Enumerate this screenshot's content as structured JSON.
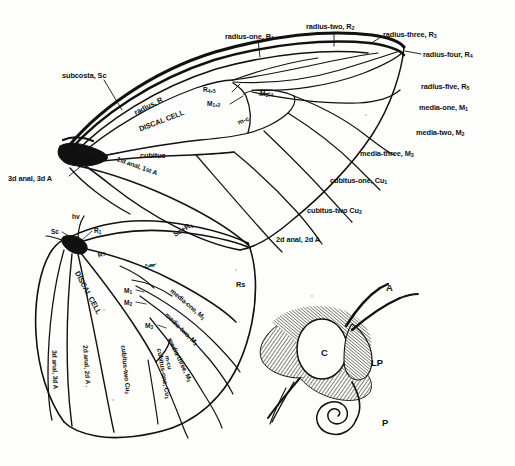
{
  "figure": {
    "kind": "lepidoptera-wing-venation-diagram",
    "ink_color": "#111111",
    "paper_color": "#fdfdfb"
  },
  "forewing": {
    "name": "forewing",
    "cell_label": "DISCAL CELL",
    "labels": [
      {
        "id": "subcosta",
        "text": "subcosta, Sc",
        "x": 62,
        "y": 72,
        "size": "s9"
      },
      {
        "id": "radius",
        "text": "radius, R",
        "x": 133,
        "y": 110,
        "size": "s9",
        "rot": -27
      },
      {
        "id": "discal-cell",
        "text": "DISCAL CELL",
        "x": 138,
        "y": 126,
        "size": "s9",
        "rot": -21
      },
      {
        "id": "cubitus",
        "text": "cubitus",
        "x": 140,
        "y": 152,
        "size": "s9"
      },
      {
        "id": "first-anal",
        "text": "1st anal, 1st A",
        "x": 118,
        "y": 156,
        "size": "s8",
        "rot": 20
      },
      {
        "id": "third-anal",
        "text": "3d anal, 3d A",
        "x": 8,
        "y": 175,
        "size": "s9"
      },
      {
        "id": "r45",
        "text": "R4+5",
        "x": 203,
        "y": 87,
        "size": "s8"
      },
      {
        "id": "m12",
        "text": "M1+2",
        "x": 207,
        "y": 101,
        "size": "s8"
      },
      {
        "id": "m34",
        "text": "M3+4",
        "x": 260,
        "y": 91,
        "size": "s8"
      },
      {
        "id": "m-c",
        "text": "m-c",
        "x": 237,
        "y": 120,
        "size": "s8",
        "rot": -22
      },
      {
        "id": "radius-one",
        "text": "radius-one, R1",
        "x": 225,
        "y": 33,
        "size": "s9"
      },
      {
        "id": "radius-two",
        "text": "radius-two, R2",
        "x": 306,
        "y": 23,
        "size": "s9"
      },
      {
        "id": "radius-three",
        "text": "radius-three, R3",
        "x": 383,
        "y": 31,
        "size": "s9"
      },
      {
        "id": "radius-four",
        "text": "radius-four, R4",
        "x": 423,
        "y": 51,
        "size": "s9"
      },
      {
        "id": "radius-five",
        "text": "radius-five, R5",
        "x": 421,
        "y": 83,
        "size": "s9"
      },
      {
        "id": "media-one",
        "text": "media-one, M1",
        "x": 419,
        "y": 104,
        "size": "s9"
      },
      {
        "id": "media-two",
        "text": "media-two, M2",
        "x": 416,
        "y": 129,
        "size": "s9"
      },
      {
        "id": "media-three",
        "text": "media-three, M3",
        "x": 360,
        "y": 150,
        "size": "s9"
      },
      {
        "id": "cubitus-one",
        "text": "cubitus-one, Cu1",
        "x": 330,
        "y": 177,
        "size": "s9"
      },
      {
        "id": "cubitus-two",
        "text": "cubitus-two Cu2",
        "x": 307,
        "y": 207,
        "size": "s9"
      },
      {
        "id": "second-anal",
        "text": "2d anal, 2d A",
        "x": 276,
        "y": 236,
        "size": "s9"
      }
    ]
  },
  "hindwing": {
    "name": "hindwing",
    "cell_label": "DISCAL CELL",
    "labels": [
      {
        "id": "humeral-vein",
        "text": "hv",
        "x": 72,
        "y": 214,
        "size": "s8"
      },
      {
        "id": "sc",
        "text": "Sc",
        "x": 51,
        "y": 229,
        "size": "s8"
      },
      {
        "id": "r1",
        "text": "R1",
        "x": 94,
        "y": 228,
        "size": "s8"
      },
      {
        "id": "rs-base",
        "text": "Rs",
        "x": 97,
        "y": 253,
        "size": "s8",
        "rot": -22
      },
      {
        "id": "discal-cell-h",
        "text": "DISCAL CELL",
        "x": 80,
        "y": 270,
        "size": "s9",
        "rot": 62
      },
      {
        "id": "r-m",
        "text": "r-m",
        "x": 145,
        "y": 262,
        "size": "s7"
      },
      {
        "id": "m1",
        "text": "M1",
        "x": 124,
        "y": 288,
        "size": "s8"
      },
      {
        "id": "m2",
        "text": "M2",
        "x": 124,
        "y": 300,
        "size": "s8"
      },
      {
        "id": "m3",
        "text": "M3",
        "x": 145,
        "y": 323,
        "size": "s8"
      },
      {
        "id": "m-cu",
        "text": "m-cu",
        "x": 170,
        "y": 355,
        "size": "s7",
        "rot": 78
      },
      {
        "id": "sc-r1",
        "text": "Sc+R1",
        "x": 172,
        "y": 232,
        "size": "s9",
        "rot": -32
      },
      {
        "id": "rs-outer",
        "text": "Rs",
        "x": 236,
        "y": 281,
        "size": "s9"
      },
      {
        "id": "media-one-h",
        "text": "media-one, M1",
        "x": 173,
        "y": 288,
        "size": "s8",
        "rot": 40
      },
      {
        "id": "media-two-h",
        "text": "media-two, M2",
        "x": 168,
        "y": 312,
        "size": "s8",
        "rot": 44
      },
      {
        "id": "media-three-h",
        "text": "media-three, M3",
        "x": 172,
        "y": 337,
        "size": "s8",
        "rot": 64
      },
      {
        "id": "cubitus-one-h",
        "text": "cubitus-one, Cu1",
        "x": 162,
        "y": 348,
        "size": "s8",
        "rot": 80
      },
      {
        "id": "cubitus-two-h",
        "text": "cubitus-two Cu2",
        "x": 126,
        "y": 345,
        "size": "s8",
        "rot": 84
      },
      {
        "id": "second-anal-h",
        "text": "2d anal, 2d A .",
        "x": 88,
        "y": 345,
        "size": "s8",
        "rot": 86
      },
      {
        "id": "third-anal-h",
        "text": "3d anal, 3d A",
        "x": 57,
        "y": 350,
        "size": "s8",
        "rot": 88
      }
    ]
  },
  "head": {
    "name": "butterfly-head-detail",
    "labels": [
      {
        "id": "antenna",
        "text": "A",
        "x": 386,
        "y": 283,
        "size": "hd"
      },
      {
        "id": "compound-eye",
        "text": "C",
        "x": 321,
        "y": 348,
        "size": "hd"
      },
      {
        "id": "labial-palp",
        "text": "LP",
        "x": 371,
        "y": 358,
        "size": "hd"
      },
      {
        "id": "proboscis",
        "text": "P",
        "x": 382,
        "y": 418,
        "size": "hd"
      }
    ]
  }
}
